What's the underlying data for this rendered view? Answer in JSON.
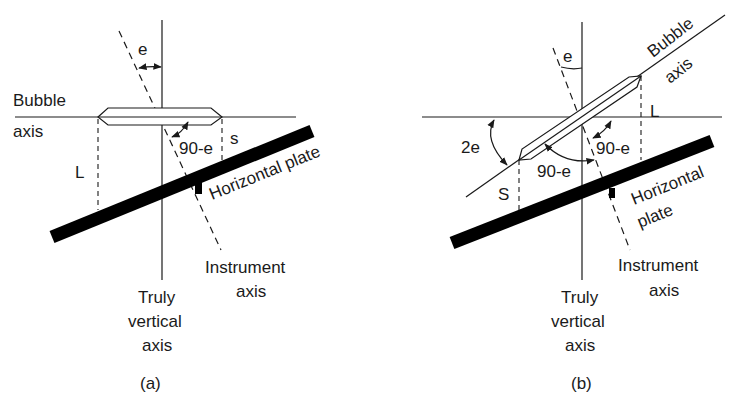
{
  "figure_a": {
    "caption": "(a)",
    "labels": {
      "e": "e",
      "bubble": "Bubble",
      "axis": "axis",
      "ninety_minus_e": "90-e",
      "s": "s",
      "L": "L",
      "horizontal_plate": "Horizontal plate",
      "instrument": "Instrument",
      "instrument_axis": "axis",
      "truly": "Truly",
      "vertical": "vertical",
      "vertical_axis": "axis"
    }
  },
  "figure_b": {
    "caption": "(b)",
    "labels": {
      "e": "e",
      "bubble": "Bubble",
      "axis": "axis",
      "L": "L",
      "two_e": "2e",
      "ninety_minus_e_right": "90-e",
      "ninety_minus_e_lower": "90-e",
      "S": "S",
      "horizontal": "Horizontal",
      "plate": "plate",
      "instrument": "Instrument",
      "instrument_axis": "axis",
      "truly": "Truly",
      "vertical": "vertical",
      "vertical_axis": "axis"
    }
  },
  "colors": {
    "ink": "#1a1a1a",
    "background": "#ffffff"
  }
}
